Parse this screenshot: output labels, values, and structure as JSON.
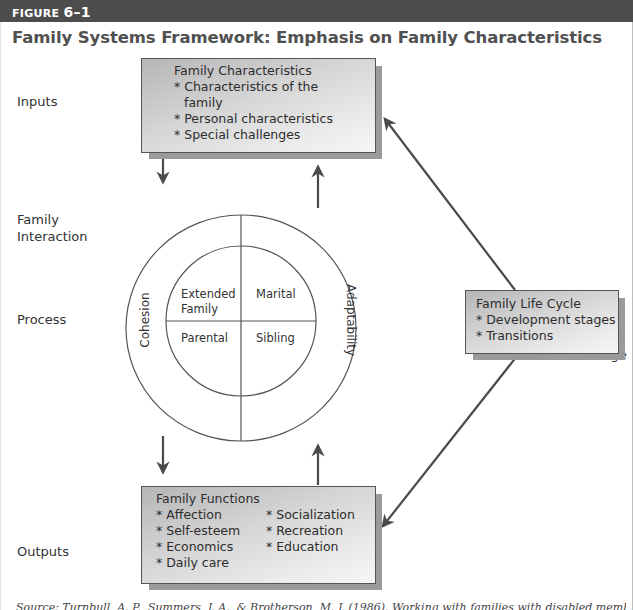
{
  "figure": {
    "label_word": "FIGURE",
    "label_number": "6–1",
    "title": "Family Systems Framework: Emphasis on Family Characteristics",
    "colors": {
      "header_bar": "#4d4d4d",
      "box_border": "#555555",
      "box_shadow": "#9a9a9a",
      "arrow": "#4a4a4a",
      "text": "#333333"
    }
  },
  "side_labels": {
    "inputs": "Inputs",
    "family_interaction_line1": "Family",
    "family_interaction_line2": "Interaction",
    "process": "Process",
    "outputs": "Outputs",
    "change": "Change"
  },
  "boxes": {
    "inputs": {
      "title": "Family Characteristics",
      "items": [
        "* Characteristics of the",
        "   family",
        "* Personal characteristics",
        "* Special challenges"
      ]
    },
    "life_cycle": {
      "title": "Family Life Cycle",
      "items": [
        "* Development stages",
        "* Transitions"
      ]
    },
    "outputs": {
      "title": "Family Functions",
      "col1": [
        "* Affection",
        "* Self-esteem",
        "* Economics",
        "* Daily care"
      ],
      "col2": [
        "* Socialization",
        "* Recreation",
        "* Education"
      ]
    }
  },
  "circle": {
    "outer_left": "Cohesion",
    "outer_right": "Adaptability",
    "quadrants": {
      "top_left_line1": "Extended",
      "top_left_line2": "Family",
      "top_right": "Marital",
      "bottom_left": "Parental",
      "bottom_right": "Sibling"
    }
  },
  "source": "Source: Turnbull, A. P., Summers, J. A., & Brotherson, M. J. (1986). Working with families with disabled members: A family systems approach."
}
